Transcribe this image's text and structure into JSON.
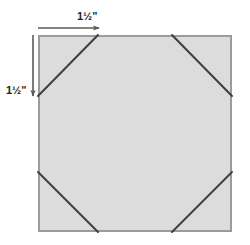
{
  "diagram": {
    "canvas": {
      "width": 250,
      "height": 245,
      "background": "#ffffff"
    },
    "square": {
      "name": "fabric-square",
      "x": 38,
      "y": 35,
      "width": 194,
      "height": 197,
      "fill_color": "#dcdcdc",
      "stroke_color": "#9b9b9b",
      "stroke_width": 2
    },
    "corner_lines": {
      "name": "corner-cut-lines",
      "stroke_color": "#3f3f3f",
      "stroke_width": 2,
      "offset": 60,
      "segments": [
        {
          "name": "corner-line-top-left",
          "x1": 38,
          "y1": 96,
          "x2": 98,
          "y2": 35
        },
        {
          "name": "corner-line-top-right",
          "x1": 172,
          "y1": 35,
          "x2": 232,
          "y2": 96
        },
        {
          "name": "corner-line-bottom-left",
          "x1": 38,
          "y1": 172,
          "x2": 98,
          "y2": 232
        },
        {
          "name": "corner-line-bottom-right",
          "x1": 172,
          "y1": 232,
          "x2": 232,
          "y2": 172
        }
      ]
    },
    "arrows": {
      "stroke_color": "#5a5a5a",
      "stroke_width": 1.6,
      "horizontal": {
        "name": "top-dimension-arrow",
        "x1": 38,
        "y1": 28,
        "x2": 100,
        "y2": 28,
        "direction": "right"
      },
      "vertical": {
        "name": "left-dimension-arrow",
        "x1": 33,
        "y1": 35,
        "x2": 33,
        "y2": 97,
        "direction": "down"
      }
    },
    "labels": {
      "top": {
        "name": "top-dimension-label",
        "text": "1½\"",
        "value": "1 1/2 inches"
      },
      "left": {
        "name": "left-dimension-label",
        "text": "1½\"",
        "value": "1 1/2 inches"
      }
    }
  }
}
